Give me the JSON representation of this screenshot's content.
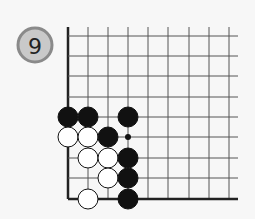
{
  "problem": {
    "number": "9",
    "badge": {
      "cx": 35,
      "cy": 45,
      "r": 17,
      "fill": "#c9c9c9",
      "stroke": "#8a8a8a",
      "text_color": "#222222"
    }
  },
  "board": {
    "cols_x": [
      68,
      88,
      108,
      128,
      148,
      168,
      189,
      209,
      229
    ],
    "rows_y": [
      36,
      56,
      76,
      97,
      117,
      137,
      158,
      178,
      199
    ],
    "top_extent": 27,
    "right_extent": 238,
    "line_color": "#555555",
    "edge_color": "#222222",
    "edges": [
      "left",
      "bottom"
    ],
    "stone_radius": 10,
    "stones": [
      {
        "color": "black",
        "col": 0,
        "row": 4
      },
      {
        "color": "black",
        "col": 1,
        "row": 4
      },
      {
        "color": "black",
        "col": 3,
        "row": 4
      },
      {
        "color": "white",
        "col": 0,
        "row": 5
      },
      {
        "color": "white",
        "col": 1,
        "row": 5
      },
      {
        "color": "black",
        "col": 2,
        "row": 5
      },
      {
        "color": "white",
        "col": 1,
        "row": 6
      },
      {
        "color": "white",
        "col": 2,
        "row": 6
      },
      {
        "color": "black",
        "col": 3,
        "row": 6
      },
      {
        "color": "white",
        "col": 2,
        "row": 7
      },
      {
        "color": "black",
        "col": 3,
        "row": 7
      },
      {
        "color": "white",
        "col": 1,
        "row": 8
      },
      {
        "color": "black",
        "col": 3,
        "row": 8
      }
    ],
    "markers": [
      {
        "type": "dot",
        "col": 3,
        "row": 5
      }
    ]
  }
}
